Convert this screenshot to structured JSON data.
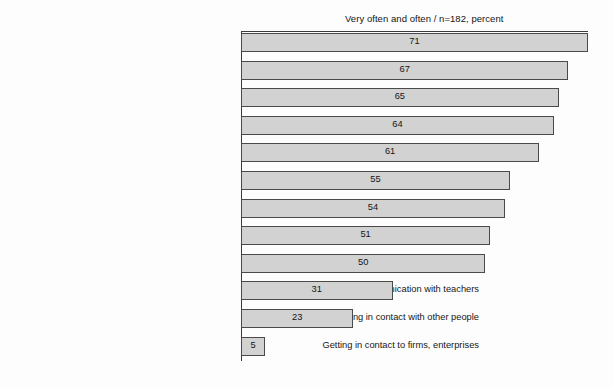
{
  "chart_data": {
    "type": "bar",
    "orientation": "horizontal",
    "title": "Very often and often  / n=182, percent",
    "xlabel": "",
    "ylabel": "",
    "xlim": [
      0,
      71
    ],
    "grid": false,
    "legend": false,
    "categories": [
      "Subject-specific questions about cou",
      "Sharing information about lectures, tutc",
      "Solving exercises collaborat",
      "Learning to handle different opir",
      "Asking sth. about exerc",
      "Preparing for examina",
      "Knowledge exchange with stuc",
      "Helping other students",
      "Asking organizational issues for lectures, tutorials, ...",
      "Communication with teachers",
      "Getting in contact with other people",
      "Getting in contact to firms, enterprises"
    ],
    "values": [
      71,
      67,
      65,
      64,
      61,
      55,
      54,
      51,
      50,
      31,
      23,
      5
    ],
    "bar_fill_color": "#d2d2d2",
    "bar_border_color": "#4a4a4a",
    "text_color": "#141414"
  }
}
